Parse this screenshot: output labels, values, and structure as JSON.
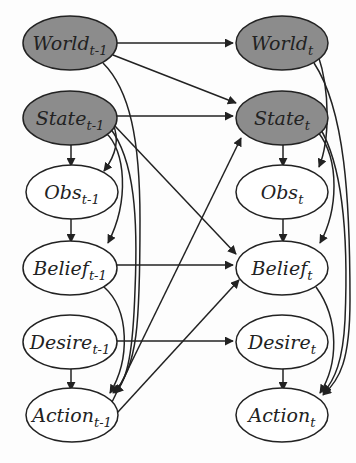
{
  "diagram": {
    "type": "dynamic-bayesian-network",
    "colors": {
      "observed_fill": "#8c8c8c",
      "hidden_fill": "#ffffff",
      "stroke": "#222222",
      "background": "#fdfdfd"
    },
    "nodes": [
      {
        "id": "world_prev",
        "base": "World",
        "sub": "t-1",
        "shaded": true,
        "cx": 70,
        "cy": 43
      },
      {
        "id": "state_prev",
        "base": "State",
        "sub": "t-1",
        "shaded": true,
        "cx": 70,
        "cy": 118
      },
      {
        "id": "obs_prev",
        "base": "Obs",
        "sub": "t-1",
        "shaded": false,
        "cx": 72,
        "cy": 192
      },
      {
        "id": "belief_prev",
        "base": "Belief",
        "sub": "t-1",
        "shaded": false,
        "cx": 70,
        "cy": 268
      },
      {
        "id": "desire_prev",
        "base": "Desire",
        "sub": "t-1",
        "shaded": false,
        "cx": 70,
        "cy": 342
      },
      {
        "id": "action_prev",
        "base": "Action",
        "sub": "t-1",
        "shaded": false,
        "cx": 72,
        "cy": 415
      },
      {
        "id": "world_t",
        "base": "World",
        "sub": "t",
        "shaded": true,
        "cx": 282,
        "cy": 43
      },
      {
        "id": "state_t",
        "base": "State",
        "sub": "t",
        "shaded": true,
        "cx": 282,
        "cy": 118
      },
      {
        "id": "obs_t",
        "base": "Obs",
        "sub": "t",
        "shaded": false,
        "cx": 282,
        "cy": 192
      },
      {
        "id": "belief_t",
        "base": "Belief",
        "sub": "t",
        "shaded": false,
        "cx": 282,
        "cy": 268
      },
      {
        "id": "desire_t",
        "base": "Desire",
        "sub": "t",
        "shaded": false,
        "cx": 282,
        "cy": 342
      },
      {
        "id": "action_t",
        "base": "Action",
        "sub": "t",
        "shaded": false,
        "cx": 282,
        "cy": 415
      }
    ],
    "edges": [
      {
        "from": "world_prev",
        "to": "world_t"
      },
      {
        "from": "world_prev",
        "to": "state_t"
      },
      {
        "from": "world_prev",
        "to": "action_prev"
      },
      {
        "from": "state_prev",
        "to": "state_t"
      },
      {
        "from": "state_prev",
        "to": "obs_prev"
      },
      {
        "from": "state_prev",
        "to": "belief_prev"
      },
      {
        "from": "state_prev",
        "to": "action_prev"
      },
      {
        "from": "state_prev",
        "to": "belief_t"
      },
      {
        "from": "obs_prev",
        "to": "belief_prev"
      },
      {
        "from": "belief_prev",
        "to": "belief_t"
      },
      {
        "from": "belief_prev",
        "to": "action_prev"
      },
      {
        "from": "desire_prev",
        "to": "desire_t"
      },
      {
        "from": "desire_prev",
        "to": "action_prev"
      },
      {
        "from": "action_prev",
        "to": "state_t"
      },
      {
        "from": "action_prev",
        "to": "belief_t"
      },
      {
        "from": "world_t",
        "to": "action_t"
      },
      {
        "from": "state_t",
        "to": "obs_t"
      },
      {
        "from": "state_t",
        "to": "belief_t"
      },
      {
        "from": "state_t",
        "to": "action_t"
      },
      {
        "from": "obs_t",
        "to": "belief_t"
      },
      {
        "from": "belief_t",
        "to": "action_t"
      },
      {
        "from": "desire_t",
        "to": "action_t"
      }
    ]
  }
}
